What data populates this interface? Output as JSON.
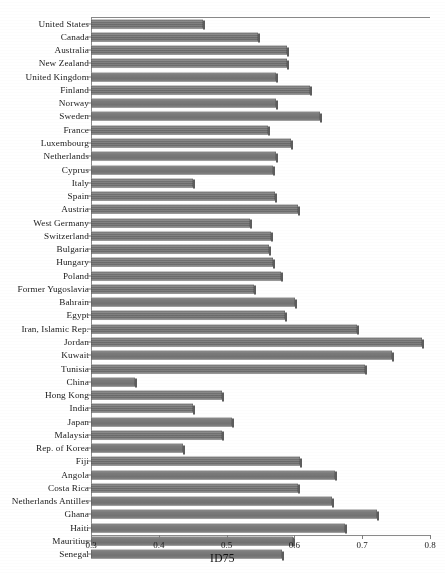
{
  "chart_data": {
    "type": "bar",
    "orientation": "horizontal",
    "title": "",
    "xlabel": "ID75",
    "ylabel": "",
    "xlim": [
      0.3,
      0.8
    ],
    "xticks": [
      0.3,
      0.4,
      0.5,
      0.6,
      0.7,
      0.8
    ],
    "xtick_labels": [
      "0.3",
      "0.4",
      "0.5",
      "0.6",
      "0.7",
      "0.8"
    ],
    "grid": false,
    "legend": null,
    "bar_color": "#767676",
    "categories": [
      "United States",
      "Canada",
      "Australia",
      "New Zealand",
      "United Kingdom",
      "Finland",
      "Norway",
      "Sweden",
      "France",
      "Luxembourg",
      "Netherlands",
      "Cyprus",
      "Italy",
      "Spain",
      "Austria",
      "West Germany",
      "Switzerland",
      "Bulgaria",
      "Hungary",
      "Poland",
      "Former Yugoslavia",
      "Bahrain",
      "Egypt",
      "Iran, Islamic Rep.",
      "Jordan",
      "Kuwait",
      "Tunisia",
      "China",
      "Hong Kong",
      "India",
      "Japan",
      "Malaysia",
      "Rep. of Korea",
      "Fiji",
      "Angola",
      "Costa Rica",
      "Netherlands  Antilles",
      "Ghana",
      "Haiti",
      "Mauritius",
      "Senegal"
    ],
    "values": [
      0.465,
      0.546,
      0.589,
      0.589,
      0.573,
      0.623,
      0.573,
      0.638,
      0.561,
      0.595,
      0.573,
      0.569,
      0.45,
      0.571,
      0.605,
      0.534,
      0.565,
      0.562,
      0.568,
      0.58,
      0.54,
      0.601,
      0.586,
      0.692,
      0.788,
      0.744,
      0.704,
      0.365,
      0.493,
      0.45,
      0.508,
      0.493,
      0.436,
      0.608,
      0.66,
      0.605,
      0.656,
      0.722,
      0.675,
      0.598,
      0.582
    ]
  }
}
